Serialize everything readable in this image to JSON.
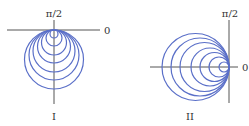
{
  "colors": {
    "curve": "#5a6fc8",
    "axis": "#555555",
    "text": "#333333"
  },
  "figures": [
    {
      "id": "I",
      "caption": "I",
      "angle_top_label": "π/2",
      "angle_right_label": "0",
      "tangent_point": [
        54,
        30
      ],
      "direction": "down",
      "circle_diameters": [
        8,
        16,
        25,
        33,
        42,
        50,
        59
      ],
      "h_axis": {
        "x1": 7,
        "x2": 100,
        "y": 30
      },
      "v_axis": {
        "x": 54,
        "y1": 20,
        "y2": 104
      }
    },
    {
      "id": "II",
      "caption": "II",
      "angle_top_label": "π/2",
      "angle_right_label": "0",
      "tangent_point": [
        229,
        67
      ],
      "direction": "left",
      "circle_diameters": [
        10,
        20,
        29,
        38,
        49,
        58,
        67
      ],
      "h_axis": {
        "x1": 150,
        "x2": 238,
        "y": 67
      },
      "v_axis": {
        "x": 229,
        "y1": 20,
        "y2": 103
      }
    }
  ]
}
